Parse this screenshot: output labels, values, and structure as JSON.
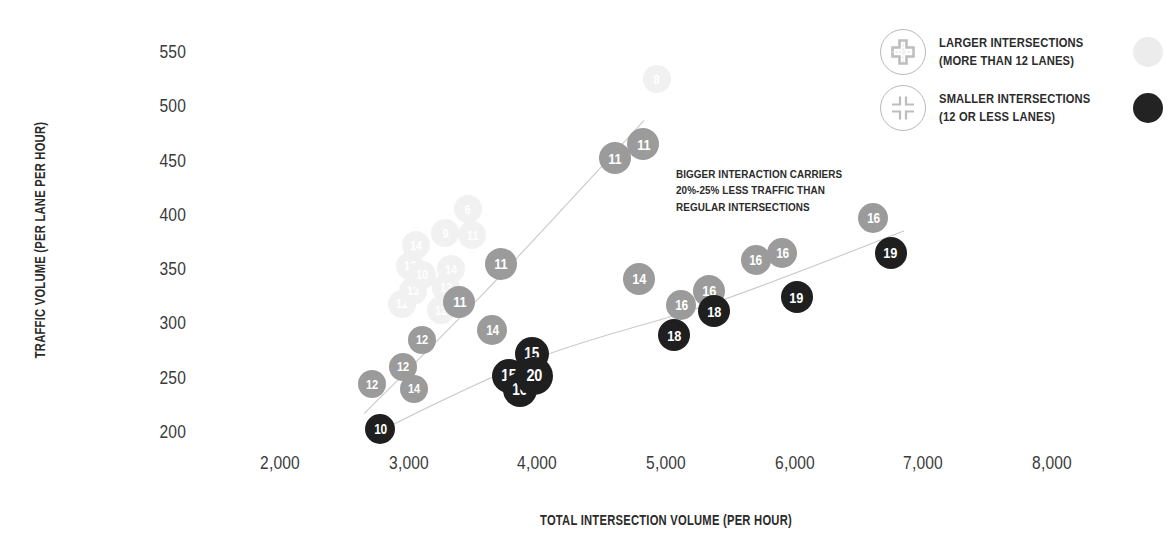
{
  "chart_data": {
    "type": "scatter",
    "title": "",
    "xlabel": "TOTAL INTERSECTION VOLUME (PER HOUR)",
    "ylabel": "TRAFFIC VOLUME (PER LANE PER HOUR)",
    "xlim": [
      1550,
      8450
    ],
    "ylim": [
      185,
      565
    ],
    "grid": false,
    "x_ticks": [
      "2,000",
      "3,000",
      "4,000",
      "5,000",
      "6,000",
      "7,000",
      "8,000"
    ],
    "x_tick_values": [
      2000,
      3000,
      4000,
      5000,
      6000,
      7000,
      8000
    ],
    "y_ticks": [
      "200",
      "250",
      "300",
      "350",
      "400",
      "450",
      "500",
      "550"
    ],
    "y_tick_values": [
      200,
      250,
      300,
      350,
      400,
      450,
      500,
      550
    ],
    "legend_position": "top-right",
    "annotation_text": "BIGGER INTERACTION CARRIERS 20%-25% LESS TRAFFIC THAN REGULAR INTERSECTIONS",
    "series": [
      {
        "name": "LARGER INTERSECTIONS (MORE THAN 12 LANES)",
        "color": "#9b9b9b",
        "faint_color": "#f1f1f1",
        "points": [
          {
            "x": 2715,
            "y": 244,
            "label": "12",
            "r": 14,
            "faint": false
          },
          {
            "x": 2955,
            "y": 260,
            "label": "12",
            "r": 14,
            "faint": false
          },
          {
            "x": 3045,
            "y": 240,
            "label": "14",
            "r": 14,
            "faint": false
          },
          {
            "x": 3105,
            "y": 285,
            "label": "12",
            "r": 14,
            "faint": false
          },
          {
            "x": 3650,
            "y": 294,
            "label": "14",
            "r": 15,
            "faint": false
          },
          {
            "x": 3395,
            "y": 320,
            "label": "11",
            "r": 16,
            "faint": false
          },
          {
            "x": 3715,
            "y": 355,
            "label": "11",
            "r": 16,
            "faint": false
          },
          {
            "x": 4605,
            "y": 452,
            "label": "11",
            "r": 16,
            "faint": false
          },
          {
            "x": 4825,
            "y": 465,
            "label": "11",
            "r": 16,
            "faint": false
          },
          {
            "x": 4790,
            "y": 341,
            "label": "14",
            "r": 16,
            "faint": false
          },
          {
            "x": 5120,
            "y": 317,
            "label": "16",
            "r": 15,
            "faint": false
          },
          {
            "x": 5335,
            "y": 330,
            "label": "16",
            "r": 16,
            "faint": false
          },
          {
            "x": 5700,
            "y": 358,
            "label": "16",
            "r": 15,
            "faint": false
          },
          {
            "x": 5905,
            "y": 365,
            "label": "16",
            "r": 15,
            "faint": false
          },
          {
            "x": 6610,
            "y": 397,
            "label": "16",
            "r": 15,
            "faint": false
          },
          {
            "x": 2950,
            "y": 318,
            "label": "12",
            "r": 14,
            "faint": true
          },
          {
            "x": 3035,
            "y": 330,
            "label": "13",
            "r": 14,
            "faint": true
          },
          {
            "x": 3010,
            "y": 353,
            "label": "13",
            "r": 14,
            "faint": true
          },
          {
            "x": 3060,
            "y": 372,
            "label": "14",
            "r": 14,
            "faint": true
          },
          {
            "x": 3105,
            "y": 345,
            "label": "10",
            "r": 14,
            "faint": true
          },
          {
            "x": 3250,
            "y": 312,
            "label": "12",
            "r": 14,
            "faint": true
          },
          {
            "x": 3290,
            "y": 333,
            "label": "13",
            "r": 14,
            "faint": true
          },
          {
            "x": 3330,
            "y": 350,
            "label": "14",
            "r": 14,
            "faint": true
          },
          {
            "x": 3285,
            "y": 383,
            "label": "9",
            "r": 14,
            "faint": true
          },
          {
            "x": 3495,
            "y": 381,
            "label": "11",
            "r": 14,
            "faint": true
          },
          {
            "x": 3460,
            "y": 405,
            "label": "6",
            "r": 14,
            "faint": true
          },
          {
            "x": 4930,
            "y": 525,
            "label": "8",
            "r": 14,
            "faint": true
          }
        ]
      },
      {
        "name": "SMALLER INTERSECTIONS (12 OR LESS LANES)",
        "color": "#1f1f1f",
        "points": [
          {
            "x": 2780,
            "y": 203,
            "label": "10",
            "r": 15,
            "faint": false
          },
          {
            "x": 3780,
            "y": 252,
            "label": "15",
            "r": 17,
            "faint": false
          },
          {
            "x": 3865,
            "y": 239,
            "label": "16",
            "r": 17,
            "faint": false
          },
          {
            "x": 3955,
            "y": 272,
            "label": "15",
            "r": 17,
            "faint": false
          },
          {
            "x": 3975,
            "y": 252,
            "label": "20",
            "r": 19,
            "faint": false
          },
          {
            "x": 5060,
            "y": 289,
            "label": "18",
            "r": 16,
            "faint": false
          },
          {
            "x": 5375,
            "y": 311,
            "label": "18",
            "r": 16,
            "faint": false
          },
          {
            "x": 6015,
            "y": 324,
            "label": "19",
            "r": 16,
            "faint": false
          },
          {
            "x": 6745,
            "y": 365,
            "label": "19",
            "r": 16,
            "faint": false
          }
        ]
      }
    ],
    "trendlines": [
      {
        "name": "larger-intersections-trend",
        "color": "#c9c9c9",
        "points": [
          [
            2655,
            217
          ],
          [
            3600,
            330
          ],
          [
            4830,
            487
          ]
        ]
      },
      {
        "name": "smaller-intersections-trend",
        "color": "#c9c9c9",
        "points": [
          [
            2720,
            198
          ],
          [
            4000,
            268
          ],
          [
            5400,
            320
          ],
          [
            6850,
            385
          ]
        ]
      }
    ]
  },
  "axes": {
    "y_title": "TRAFFIC VOLUME (PER LANE PER HOUR)",
    "x_title": "TOTAL INTERSECTION VOLUME (PER HOUR)"
  },
  "annotation": {
    "line1": "BIGGER INTERACTION CARRIERS",
    "line2": "20%-25% LESS TRAFFIC THAN",
    "line3": "REGULAR INTERSECTIONS"
  },
  "legend": {
    "items": [
      {
        "icon": "large-intersection-icon",
        "line1": "LARGER INTERSECTIONS",
        "line2": "(MORE THAN 12 LANES)",
        "swatch_color": "#ececec"
      },
      {
        "icon": "small-intersection-icon",
        "line1": "SMALLER INTERSECTIONS",
        "line2": "(12 OR LESS LANES)",
        "swatch_color": "#232323"
      }
    ]
  },
  "colors": {
    "gray_bubble": "#9b9b9b",
    "dark_bubble": "#1f1f1f",
    "faint_bubble": "#f2f2f2",
    "trendline": "#c9c9c9",
    "text": "#2b2b2b"
  }
}
